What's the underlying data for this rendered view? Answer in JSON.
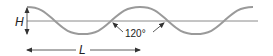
{
  "diagram": {
    "type": "sine-wave-dimension",
    "labels": {
      "height": "H",
      "length": "L",
      "angle": "120°"
    },
    "colors": {
      "wave": "#9a9a9a",
      "axis": "#8a8a8a",
      "annotation": "#333333"
    }
  }
}
